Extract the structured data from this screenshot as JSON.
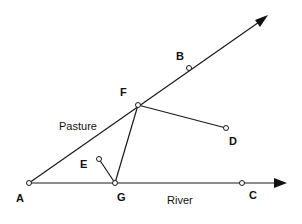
{
  "diagram": {
    "points": [
      {
        "id": "A",
        "label": "A",
        "x": 29,
        "y": 183,
        "lx": 16,
        "ly": 202
      },
      {
        "id": "G",
        "label": "G",
        "x": 115,
        "y": 183,
        "lx": 117,
        "ly": 201
      },
      {
        "id": "C",
        "label": "C",
        "x": 242,
        "y": 183,
        "lx": 249,
        "ly": 199
      },
      {
        "id": "F",
        "label": "F",
        "x": 138,
        "y": 105,
        "lx": 120,
        "ly": 96
      },
      {
        "id": "B",
        "label": "B",
        "x": 189,
        "y": 68,
        "lx": 176,
        "ly": 60
      },
      {
        "id": "D",
        "label": "D",
        "x": 226,
        "y": 128,
        "lx": 229,
        "ly": 145
      },
      {
        "id": "E",
        "label": "E",
        "x": 99,
        "y": 159,
        "lx": 80,
        "ly": 168
      }
    ],
    "rays": [
      {
        "from": "A",
        "to_x": 268,
        "to_y": 15,
        "name": "Pasture"
      },
      {
        "from": "A",
        "to_x": 286,
        "to_y": 183,
        "name": "River"
      }
    ],
    "segments": [
      {
        "from": "F",
        "to": "D"
      },
      {
        "from": "F",
        "to": "G"
      },
      {
        "from": "E",
        "to": "G"
      }
    ],
    "region_labels": {
      "pasture": "Pasture",
      "river": "River"
    }
  }
}
